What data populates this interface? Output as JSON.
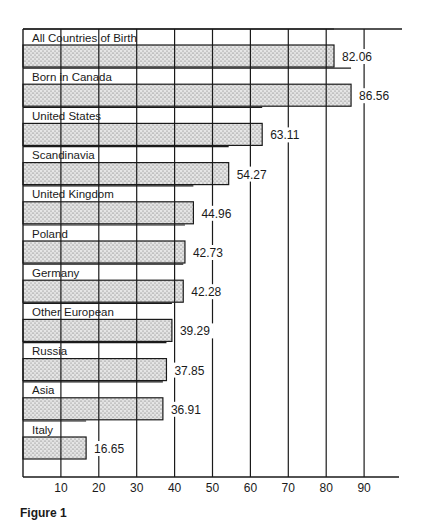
{
  "chart_data": {
    "type": "bar",
    "orientation": "horizontal",
    "title": "",
    "xlabel": "",
    "ylabel": "",
    "categories": [
      "All Countries of Birth",
      "Born in Canada",
      "United States",
      "Scandinavia",
      "United Kingdom",
      "Poland",
      "Germany",
      "Other European",
      "Russia",
      "Asia",
      "Italy"
    ],
    "values": [
      82.06,
      86.56,
      63.11,
      54.27,
      44.96,
      42.73,
      42.28,
      39.29,
      37.85,
      36.91,
      16.65
    ],
    "value_labels": [
      "82.06",
      "86.56",
      "63.11",
      "54.27",
      "44.96",
      "42.73",
      "42.28",
      "39.29",
      "37.85",
      "36.91",
      "16.65"
    ],
    "x_ticks": [
      10,
      20,
      30,
      40,
      50,
      60,
      70,
      80,
      90
    ],
    "xlim": [
      0,
      100
    ],
    "grid": true,
    "bar_fill": "stippled gray",
    "legend": null
  },
  "figure": {
    "caption": "Figure 1"
  },
  "colors": {
    "ink": "#1a1a1a",
    "bar_fill": "#d9d9d9",
    "background": "#ffffff"
  }
}
